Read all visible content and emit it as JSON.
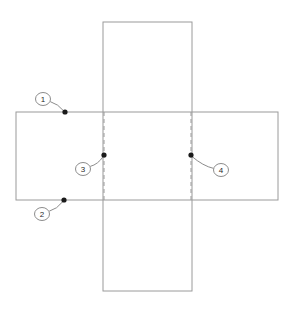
{
  "diagram": {
    "canvas": {
      "width": 287,
      "height": 312,
      "background": "#ffffff"
    },
    "style": {
      "solid_line_color": "#9a9a9a",
      "dashed_line_color": "#9a9a9a",
      "leader_line_color": "#8c8c8c",
      "dot_color": "#1a1a1a",
      "callout_circle_fill": "#ffffff",
      "callout_circle_stroke": "#8c8c8c",
      "callout_text_color": "#2a2a2a",
      "line_width": 1,
      "dash_pattern": "4 3"
    },
    "shapes": {
      "horizontal_panel": {
        "x": 16,
        "y": 112,
        "width": 262,
        "height": 88
      },
      "vertical_panel": {
        "x": 103,
        "y": 22,
        "width": 89,
        "height": 269
      },
      "fold_line_left": {
        "x": 104,
        "y1": 112,
        "y2": 200
      },
      "fold_line_right": {
        "x": 191,
        "y1": 112,
        "y2": 200
      }
    },
    "callouts": [
      {
        "id": "callout-1",
        "label": "1",
        "circle": {
          "cx": 43,
          "cy": 99,
          "rx": 7.5,
          "ry": 6.5
        },
        "dot": {
          "cx": 65,
          "cy": 112,
          "r": 2.6
        },
        "leader": "M 50.2 101.6 Q 58 103.8 64.2 111.4"
      },
      {
        "id": "callout-2",
        "label": "2",
        "circle": {
          "cx": 42,
          "cy": 214,
          "rx": 7.5,
          "ry": 6.5
        },
        "dot": {
          "cx": 64,
          "cy": 200,
          "r": 2.6
        },
        "leader": "M 49.2 211.2 Q 57 209.2 63.2 201.2"
      },
      {
        "id": "callout-3",
        "label": "3",
        "circle": {
          "cx": 83,
          "cy": 169,
          "rx": 7.5,
          "ry": 6.5
        },
        "dot": {
          "cx": 104,
          "cy": 155,
          "r": 2.6
        },
        "leader": "M 90.2 166.4 Q 98 164.4 103.4 156.2"
      },
      {
        "id": "callout-4",
        "label": "4",
        "circle": {
          "cx": 221,
          "cy": 170,
          "rx": 7.5,
          "ry": 6.5
        },
        "dot": {
          "cx": 191,
          "cy": 155,
          "r": 2.6
        },
        "leader": "M 213.6 168.4 Q 203 166 191.6 156.2"
      }
    ]
  }
}
